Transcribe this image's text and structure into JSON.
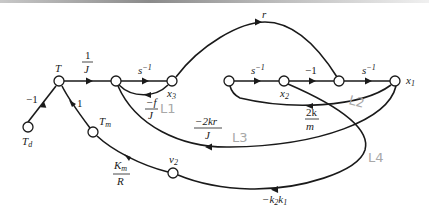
{
  "diagram": {
    "type": "signal-flow-graph",
    "nodes": {
      "Td": {
        "label": "T",
        "sub": "d"
      },
      "T": {
        "label": "T"
      },
      "x3": {
        "label": "x",
        "sub": "3"
      },
      "x2": {
        "label": "x",
        "sub": "2"
      },
      "x1": {
        "label": "x",
        "sub": "1"
      },
      "Tm": {
        "label": "T",
        "sub": "m"
      },
      "v2": {
        "label": "v",
        "sub": "2"
      }
    },
    "gains": {
      "td_to_t": "−1",
      "tm_to_t": "1",
      "inv_j_num": "1",
      "inv_j_den": "J",
      "s_inv_1": "s",
      "s_inv_2": "s",
      "s_inv_3": "s",
      "s_inv_sup": "−1",
      "minus_one": "−1",
      "r": "r",
      "f_over_j_num": "−f",
      "f_over_j_den": "J",
      "two_kr_num": "−2kr",
      "two_kr_den": "J",
      "two_k_m_num": "2k",
      "two_k_m_den": "m",
      "km_r_num": "K",
      "km_r_num_sub": "m",
      "km_r_den": "R",
      "k2k1_a": "−k",
      "k2k1_sub1": "2",
      "k2k1_b": "k",
      "k2k1_sub2": "1"
    },
    "annotations": {
      "L1": "L1",
      "L2": "L2",
      "L3": "L3",
      "L4": "L4"
    }
  }
}
